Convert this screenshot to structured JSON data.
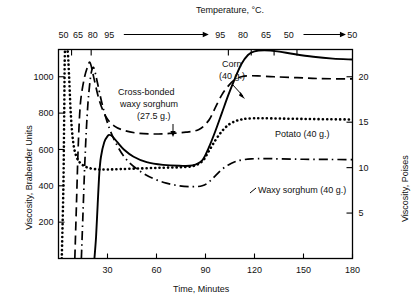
{
  "figure": {
    "top_axis_title": "Temperature, °C.",
    "left_axis_title": "Viscosity, Brabender Units",
    "right_axis_title": "Viscosity, Poises",
    "bottom_axis_title": "Time, Minutes"
  },
  "labels": {
    "corn_line1": "Corn",
    "corn_line2": "(40 g.)",
    "cross_line1": "Cross-bonded",
    "cross_line2": "waxy sorghum",
    "cross_line3": "(27.5 g.)",
    "potato": "Potato (40 g.)",
    "waxy": "Waxy sorghum (40 g.)"
  },
  "chart_data": {
    "type": "line",
    "title": "",
    "xlabel": "Time, Minutes",
    "ylabel": "Viscosity, Brabender Units",
    "y2label": "Viscosity, Poises",
    "x2label": "Temperature, °C.",
    "xlim": [
      0,
      180
    ],
    "ylim": [
      0,
      1150
    ],
    "y2lim": [
      0,
      23
    ],
    "grid": false,
    "legend": "inline-annotations",
    "xticks": [
      30,
      60,
      90,
      120,
      150,
      180
    ],
    "xtick_labels": [
      "30",
      "60",
      "90",
      "120",
      "150",
      "180"
    ],
    "yticks": [
      200,
      400,
      600,
      800,
      1000
    ],
    "ytick_labels": [
      "200",
      "400",
      "600",
      "800",
      "1000"
    ],
    "y2ticks": [
      5,
      10,
      15,
      20
    ],
    "y2tick_labels": [
      "5",
      "10",
      "15",
      "20"
    ],
    "top_axis": {
      "label": "Temperature, °C.",
      "heating_labels": [
        "50",
        "65",
        "80",
        "95"
      ],
      "heating_label_x": [
        3,
        12,
        21,
        31
      ],
      "hold_label": "95",
      "cooling_labels": [
        "95",
        "80",
        "65",
        "50"
      ],
      "cooling_label_x": [
        99,
        113,
        127,
        141
      ],
      "final_label": "50",
      "final_label_x": [
        178
      ],
      "ticks_min": [
        8,
        20,
        104,
        118,
        132,
        146
      ],
      "arrows": [
        {
          "from": 40,
          "to": 92
        },
        {
          "from": 150,
          "to": 176
        }
      ]
    },
    "series": [
      {
        "name": "Corn (40 g.)",
        "style": "solid",
        "points": [
          [
            22,
            0
          ],
          [
            23,
            120
          ],
          [
            24,
            300
          ],
          [
            25,
            470
          ],
          [
            26,
            560
          ],
          [
            28,
            640
          ],
          [
            30,
            672
          ],
          [
            31,
            680
          ],
          [
            33,
            672
          ],
          [
            36,
            640
          ],
          [
            40,
            600
          ],
          [
            46,
            560
          ],
          [
            54,
            530
          ],
          [
            64,
            515
          ],
          [
            74,
            510
          ],
          [
            82,
            512
          ],
          [
            88,
            540
          ],
          [
            92,
            610
          ],
          [
            96,
            700
          ],
          [
            100,
            800
          ],
          [
            104,
            900
          ],
          [
            108,
            990
          ],
          [
            112,
            1070
          ],
          [
            116,
            1120
          ],
          [
            120,
            1140
          ],
          [
            126,
            1145
          ],
          [
            134,
            1140
          ],
          [
            144,
            1125
          ],
          [
            156,
            1110
          ],
          [
            168,
            1100
          ],
          [
            180,
            1095
          ]
        ]
      },
      {
        "name": "Cross-bonded waxy sorghum (27.5 g.)",
        "style": "dashed",
        "points": [
          [
            10,
            0
          ],
          [
            11,
            300
          ],
          [
            12,
            600
          ],
          [
            13,
            800
          ],
          [
            14,
            900
          ],
          [
            16,
            1000
          ],
          [
            18,
            1060
          ],
          [
            19,
            1080
          ],
          [
            20,
            1060
          ],
          [
            22,
            980
          ],
          [
            25,
            870
          ],
          [
            29,
            780
          ],
          [
            34,
            730
          ],
          [
            40,
            705
          ],
          [
            48,
            690
          ],
          [
            58,
            685
          ],
          [
            68,
            688
          ],
          [
            78,
            695
          ],
          [
            86,
            710
          ],
          [
            92,
            760
          ],
          [
            96,
            830
          ],
          [
            100,
            900
          ],
          [
            104,
            950
          ],
          [
            108,
            985
          ],
          [
            112,
            1000
          ],
          [
            116,
            1005
          ],
          [
            122,
            1005
          ],
          [
            132,
            1000
          ],
          [
            146,
            995
          ],
          [
            160,
            990
          ],
          [
            180,
            988
          ]
        ]
      },
      {
        "name": "Potato (40 g.)",
        "style": "dotted",
        "points": [
          [
            2,
            0
          ],
          [
            3,
            400
          ],
          [
            3.5,
            800
          ],
          [
            4,
            1150
          ],
          [
            5.5,
            1150
          ],
          [
            6.5,
            1000
          ],
          [
            7.5,
            800
          ],
          [
            9,
            640
          ],
          [
            11,
            560
          ],
          [
            14,
            520
          ],
          [
            18,
            500
          ],
          [
            24,
            490
          ],
          [
            30,
            490
          ],
          [
            38,
            492
          ],
          [
            48,
            495
          ],
          [
            58,
            498
          ],
          [
            66,
            500
          ],
          [
            74,
            502
          ],
          [
            82,
            508
          ],
          [
            88,
            535
          ],
          [
            92,
            590
          ],
          [
            96,
            650
          ],
          [
            100,
            700
          ],
          [
            104,
            735
          ],
          [
            108,
            755
          ],
          [
            112,
            765
          ],
          [
            116,
            770
          ],
          [
            124,
            772
          ],
          [
            136,
            770
          ],
          [
            150,
            768
          ],
          [
            165,
            766
          ],
          [
            180,
            765
          ]
        ]
      },
      {
        "name": "Waxy sorghum (40 g.)",
        "style": "dashdot",
        "points": [
          [
            14,
            0
          ],
          [
            15,
            250
          ],
          [
            16,
            500
          ],
          [
            17,
            700
          ],
          [
            18,
            850
          ],
          [
            19,
            950
          ],
          [
            20,
            1020
          ],
          [
            21,
            1050
          ],
          [
            22,
            1040
          ],
          [
            24,
            960
          ],
          [
            27,
            840
          ],
          [
            31,
            720
          ],
          [
            36,
            620
          ],
          [
            42,
            540
          ],
          [
            50,
            480
          ],
          [
            58,
            440
          ],
          [
            66,
            415
          ],
          [
            74,
            400
          ],
          [
            82,
            395
          ],
          [
            88,
            400
          ],
          [
            92,
            420
          ],
          [
            96,
            455
          ],
          [
            100,
            490
          ],
          [
            104,
            515
          ],
          [
            108,
            532
          ],
          [
            112,
            542
          ],
          [
            118,
            548
          ],
          [
            126,
            550
          ],
          [
            136,
            548
          ],
          [
            150,
            546
          ],
          [
            165,
            545
          ],
          [
            180,
            544
          ]
        ]
      }
    ]
  }
}
